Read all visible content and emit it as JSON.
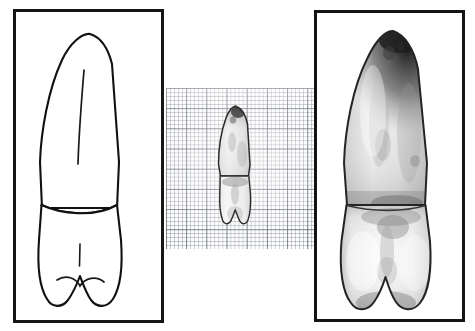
{
  "figure": {
    "background_color": "#ffffff",
    "width": 475,
    "height": 331,
    "panel_count": 3
  },
  "panels": [
    {
      "id": "drawing",
      "name": "line-drawing-panel",
      "label": "Line drawing of tooth (labial view)",
      "border_color": "#161616",
      "fill_color": "#ffffff",
      "x": 13,
      "y": 9,
      "width": 151,
      "height": 314,
      "content_type": "line-drawing"
    },
    {
      "id": "graph-paper",
      "name": "graph-paper-panel",
      "label": "Tooth photograph on millimetre graph paper",
      "border_color": "none",
      "fill_color": "#fdfdfd",
      "x": 166,
      "y": 88,
      "width": 150,
      "height": 161,
      "content_type": "photograph-on-grid",
      "grid": {
        "minor_spacing_px": 4.04,
        "major_spacing_px": 20.2,
        "minor_per_major": 5,
        "minor_color": "#8c929c",
        "major_color": "#5a5f69"
      }
    },
    {
      "id": "photo",
      "name": "photograph-panel",
      "label": "Enlarged photograph of tooth (labial view)",
      "border_color": "#141414",
      "fill_color": "#ffffff",
      "x": 314,
      "y": 10,
      "width": 151,
      "height": 312,
      "content_type": "photograph"
    }
  ],
  "tooth": {
    "common_name": "tooth",
    "view": "labial",
    "parts": [
      {
        "name": "root",
        "description": "Long tapering root occupying upper two-thirds"
      },
      {
        "name": "root-apex",
        "description": "Pointed apex at top, darkly shaded in photographs"
      },
      {
        "name": "root-groove",
        "description": "Longitudinal developmental groove line on root"
      },
      {
        "name": "cervical-line",
        "description": "Cemento-enamel junction separating root from crown"
      },
      {
        "name": "crown",
        "description": "Broad crown occupying lower third"
      },
      {
        "name": "crown-groove",
        "description": "Short vertical developmental groove on crown surface"
      },
      {
        "name": "incisal-notch",
        "description": "Central notch in the incisal/occlusal edge forming two lobes"
      }
    ],
    "shading": {
      "highlight": "#fdfdfd",
      "midtone": "#b4b4b4",
      "shadow": "#4a4a4a",
      "outline": "#1a1a1a"
    }
  },
  "annotations": {
    "caption": "",
    "scale_note": "",
    "labels": []
  }
}
